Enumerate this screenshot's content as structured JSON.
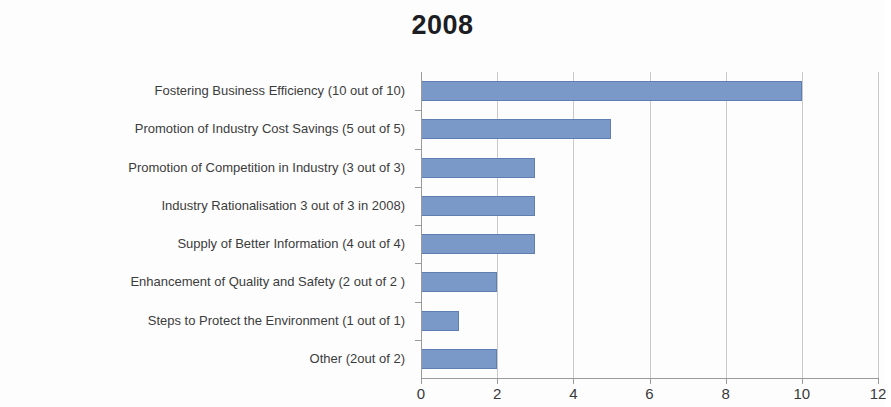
{
  "chart_data": {
    "type": "bar",
    "orientation": "horizontal",
    "title": "2008",
    "xlabel": "",
    "ylabel": "",
    "xlim": [
      0,
      12
    ],
    "xticks": [
      0,
      2,
      4,
      6,
      8,
      10,
      12
    ],
    "grid": true,
    "grid_axis": "x",
    "legend": false,
    "bar_color": "#7a98c8",
    "bar_border_color": "#5f7fb2",
    "title_color": "#1d1d24",
    "label_color": "#3c3c3c",
    "gridline_color": "#c9c9c9",
    "axis_color": "#9a9a9a",
    "categories": [
      "Fostering Business Efficiency  (10 out of 10)",
      "Promotion of Industry Cost Savings (5 out of 5)",
      "Promotion of Competition in Industry (3 out of 3)",
      "Industry Rationalisation 3 out of 3 in 2008)",
      "Supply of Better Information (4 out of 4)",
      "Enhancement of Quality and Safety (2 out of 2 )",
      "Steps to Protect the Environment (1 out of 1)",
      "Other (2out of 2)"
    ],
    "values": [
      10,
      5,
      3,
      3,
      3,
      2,
      1,
      2
    ]
  }
}
